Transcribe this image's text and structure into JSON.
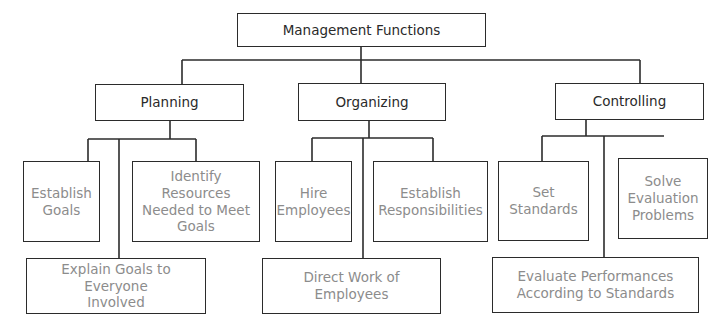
{
  "diagram": {
    "type": "org-chart",
    "root": {
      "label": "Management Functions"
    },
    "functions": [
      {
        "label": "Planning",
        "children": [
          {
            "label": "Establish\nGoals",
            "text": "Establish Goals"
          },
          {
            "label": "Identify Resources\nNeeded to Meet\nGoals",
            "text": "Identify Resources Needed to Meet Goals"
          },
          {
            "label": "Explain Goals to Everyone\nInvolved",
            "text": "Explain Goals to Everyone Involved"
          }
        ]
      },
      {
        "label": "Organizing",
        "children": [
          {
            "label": "Hire\nEmployees",
            "text": "Hire Employees"
          },
          {
            "label": "Establish\nResponsibilities",
            "text": "Establish Responsibilities"
          },
          {
            "label": "Direct Work of\nEmployees",
            "text": "Direct Work of Employees"
          }
        ]
      },
      {
        "label": "Controlling",
        "children": [
          {
            "label": "Set\nStandards",
            "text": "Set Standards"
          },
          {
            "label": "Solve\nEvaluation\nProblems",
            "text": "Solve Evaluation Problems"
          },
          {
            "label": "Evaluate Performances\nAccording to Standards",
            "text": "Evaluate Performances According to Standards"
          }
        ]
      }
    ]
  },
  "colors": {
    "line": "#2b2b2b",
    "head_text": "#2a2a2a",
    "leaf_text": "#8c8c8c",
    "background": "#ffffff"
  }
}
